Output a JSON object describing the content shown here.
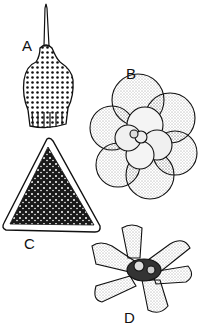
{
  "figure": {
    "panels": [
      {
        "label": "A",
        "subject": "flask-shaped microfossil with apical spine and pitted surface"
      },
      {
        "label": "B",
        "subject": "spiral chambered foraminifera (rosette of globular chambers)"
      },
      {
        "label": "C",
        "subject": "triangular reticulate microfossil with rim"
      },
      {
        "label": "D",
        "subject": "star-shaped microfossil with radiating flattened arms"
      }
    ],
    "colors": {
      "ink": "#111111",
      "background": "#ffffff"
    }
  }
}
